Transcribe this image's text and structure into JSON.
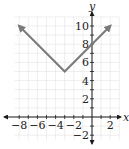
{
  "chart_data": {
    "type": "line",
    "title": "",
    "function": "y = |x + 3| + 5",
    "xlabel": "x",
    "ylabel": "y",
    "xlim": [
      -8.5,
      3
    ],
    "ylim": [
      -2.5,
      11
    ],
    "grid": true,
    "x_ticks": [
      -8,
      -7,
      -6,
      -5,
      -4,
      -3,
      -2,
      -1,
      1,
      2
    ],
    "x_tick_labels": [
      {
        "value": -8,
        "label": "−8"
      },
      {
        "value": -6,
        "label": "−6"
      },
      {
        "value": -4,
        "label": "−4"
      },
      {
        "value": -2,
        "label": "−2"
      },
      {
        "value": 2,
        "label": "2"
      }
    ],
    "y_ticks": [
      -2,
      -1,
      1,
      2,
      3,
      4,
      5,
      6,
      7,
      8,
      9,
      10
    ],
    "y_tick_labels": [
      {
        "value": -2,
        "label": "−2"
      },
      {
        "value": 2,
        "label": "2"
      },
      {
        "value": 4,
        "label": "4"
      },
      {
        "value": 6,
        "label": "6"
      },
      {
        "value": 8,
        "label": "8"
      },
      {
        "value": 10,
        "label": "10"
      }
    ],
    "series": [
      {
        "name": "absolute value graph",
        "points": [
          [
            -8,
            10
          ],
          [
            -3,
            5
          ],
          [
            2,
            10
          ]
        ],
        "vertex": [
          -3,
          5
        ],
        "y_intercept": [
          0,
          8
        ],
        "arrows_at_ends": true,
        "color": "#7a7a7a"
      }
    ]
  },
  "colors": {
    "grid": "#e2e2e2",
    "axis": "#1a1a1a",
    "curve": "#7a7a7a"
  }
}
